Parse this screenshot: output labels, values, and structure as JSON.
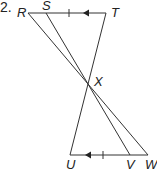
{
  "problem_number": "2.",
  "points": {
    "R": {
      "label": "R",
      "x": 28,
      "y": 13
    },
    "S": {
      "label": "S",
      "x": 46,
      "y": 13
    },
    "T": {
      "label": "T",
      "x": 106,
      "y": 13
    },
    "X": {
      "label": "X",
      "x": 88,
      "y": 82
    },
    "U": {
      "label": "U",
      "x": 70,
      "y": 155
    },
    "V": {
      "label": "V",
      "x": 130,
      "y": 155
    },
    "W": {
      "label": "W",
      "x": 148,
      "y": 155
    }
  },
  "segments": [
    "RT",
    "UW",
    "RW",
    "SV",
    "TU"
  ],
  "markings": {
    "parallel_arrows": [
      "ST",
      "UV"
    ],
    "congruent_ticks": [
      "ST",
      "UV"
    ]
  },
  "colors": {
    "stroke": "#333333",
    "text": "#222222"
  }
}
